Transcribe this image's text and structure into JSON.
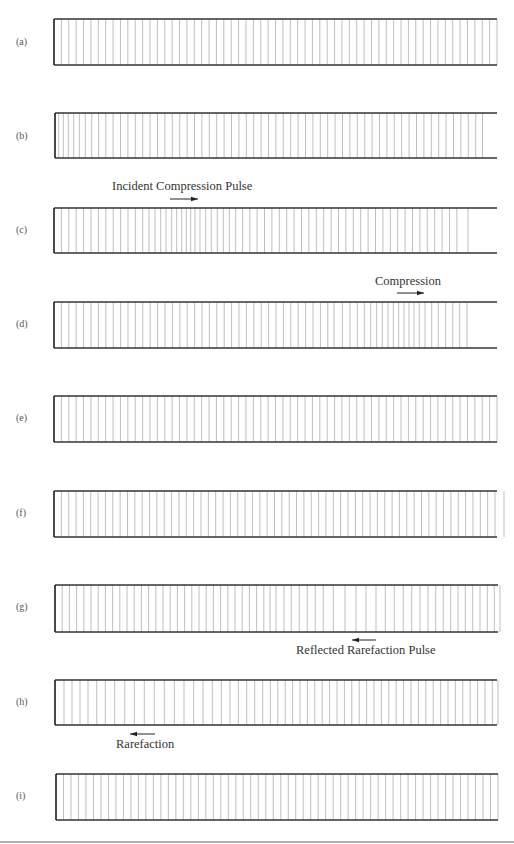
{
  "figure": {
    "colors": {
      "tube_edge": "#333333",
      "particle_line": "#b8b8b8",
      "label": "#555555",
      "annotation": "#333333",
      "page_rule": "#9a9a9a"
    },
    "panels": [
      {
        "id": "a",
        "label": "(a)",
        "label_y": 45,
        "top": 19,
        "bottom": 65,
        "left": 54,
        "right": 497,
        "lines": {
          "mode": "uniform",
          "start": 54,
          "end": 497,
          "count": 61
        }
      },
      {
        "id": "b",
        "label": "(b)",
        "label_y": 139,
        "top": 113,
        "bottom": 158,
        "left": 55,
        "right": 497,
        "lines": {
          "mode": "explicit",
          "x": [
            55,
            58.7,
            63.3,
            68.3,
            73.7,
            79.3,
            85.3,
            91.7,
            98.6,
            105.8,
            113.1,
            120.5,
            127.9,
            135.3,
            142.7,
            150.1,
            157.5,
            164.9,
            172.3,
            179.7,
            187.1,
            194.5,
            201.9,
            209.3,
            216.7,
            224.1,
            231.5,
            238.9,
            246.3,
            253.7,
            261.1,
            268.5,
            275.9,
            283.3,
            290.7,
            298.1,
            305.5,
            312.9,
            320.3,
            327.7,
            335.1,
            342.5,
            349.9,
            357.3,
            364.7,
            372.1,
            379.5,
            386.9,
            394.3,
            401.7,
            409.1,
            416.5,
            423.9,
            431.3,
            438.7,
            446.1,
            453.5,
            460.9,
            468.3,
            475.7,
            482.5
          ]
        }
      },
      {
        "id": "c",
        "label": "(c)",
        "label_y": 233,
        "top": 208,
        "bottom": 253,
        "left": 54,
        "right": 497,
        "annotation": {
          "text": "Incident Compression Pulse",
          "x": 112,
          "y": 190,
          "arrow": {
            "direction": "right",
            "x1": 170,
            "x2": 198,
            "y": 199
          }
        },
        "lines": {
          "mode": "explicit",
          "x": [
            54,
            61.4,
            68.8,
            76.2,
            83.6,
            91,
            98.4,
            105.8,
            113.2,
            120.6,
            128,
            135.4,
            142.7,
            149,
            155,
            160.7,
            166,
            171.7,
            176.7,
            181.7,
            186.3,
            190.7,
            195,
            200,
            205.7,
            211.3,
            217.3,
            223.3,
            229.3,
            235.7,
            242.6,
            249.8,
            257.1,
            264.5,
            271.9,
            279.3,
            286.7,
            294.1,
            301.5,
            308.9,
            316.3,
            323.7,
            331.1,
            338.5,
            345.9,
            353.3,
            360.7,
            368.1,
            375.5,
            382.9,
            390.3,
            397.7,
            405.1,
            412.5,
            419.9,
            427.3,
            434.7,
            442.1,
            449.5,
            456.9,
            468
          ]
        }
      },
      {
        "id": "d",
        "label": "(d)",
        "label_y": 327,
        "top": 302,
        "bottom": 348,
        "left": 54,
        "right": 497,
        "annotation": {
          "text": "Compression",
          "x": 375,
          "y": 285,
          "arrow": {
            "direction": "right",
            "x1": 397,
            "x2": 424,
            "y": 293
          }
        },
        "lines": {
          "mode": "explicit",
          "x": [
            54,
            61.4,
            68.8,
            76.2,
            83.6,
            91,
            98.4,
            105.8,
            113.2,
            120.6,
            128,
            135.4,
            142.8,
            150.2,
            157.6,
            165,
            172.4,
            179.8,
            187.2,
            194.6,
            202,
            209.4,
            216.8,
            224.2,
            231.6,
            239,
            246.4,
            253.8,
            261.2,
            268.6,
            276,
            283.4,
            290.8,
            298.2,
            305.6,
            313,
            320.4,
            327.8,
            334,
            342.3,
            350,
            357.3,
            364.3,
            370.7,
            376.7,
            382.3,
            388,
            393.3,
            398.7,
            404,
            409,
            414,
            419.3,
            425,
            431.7,
            438.3,
            445.7,
            452.7,
            459.7,
            467
          ]
        }
      },
      {
        "id": "e",
        "label": "(e)",
        "label_y": 421,
        "top": 396,
        "bottom": 442,
        "left": 54,
        "right": 497,
        "lines": {
          "mode": "uniform",
          "start": 54,
          "end": 497,
          "count": 61
        }
      },
      {
        "id": "f",
        "label": "(f)",
        "label_y": 516,
        "top": 491,
        "bottom": 537,
        "left": 54,
        "right": 497,
        "lines": {
          "mode": "uniform",
          "start": 54,
          "end": 495,
          "count": 61,
          "extra": [
            504
          ]
        }
      },
      {
        "id": "g",
        "label": "(g)",
        "label_y": 610,
        "top": 585,
        "bottom": 632,
        "left": 55,
        "right": 498,
        "annotation": {
          "text": "Reflected Rarefaction Pulse",
          "x": 296,
          "y": 654,
          "arrow": {
            "direction": "left",
            "x1": 352,
            "x2": 376,
            "y": 640
          }
        },
        "lines": {
          "mode": "explicit",
          "x": [
            55,
            62.2,
            69.4,
            76.6,
            83.8,
            91,
            98.2,
            105.4,
            112.6,
            119.8,
            127,
            134.2,
            141.4,
            148.6,
            155.8,
            163,
            170.2,
            177.4,
            184.6,
            191.8,
            199,
            206.2,
            213.4,
            220.6,
            227.8,
            235,
            242.2,
            249.4,
            256.6,
            263.8,
            270,
            276,
            284,
            291.3,
            299.3,
            307.3,
            315.3,
            323.3,
            333.3,
            345,
            356,
            366,
            376,
            385.3,
            394.3,
            403.3,
            411.7,
            420,
            428,
            435.7,
            443.3,
            450.7,
            458,
            465.3,
            472.7,
            480,
            487.3,
            494.3,
            500
          ]
        }
      },
      {
        "id": "h",
        "label": "(h)",
        "label_y": 705,
        "top": 680,
        "bottom": 725,
        "left": 55,
        "right": 497,
        "annotation": {
          "text": "Rarefaction",
          "x": 116,
          "y": 748,
          "arrow": {
            "direction": "left",
            "x1": 130,
            "x2": 155,
            "y": 734
          }
        },
        "lines": {
          "mode": "explicit",
          "x": [
            55,
            64,
            72,
            80,
            88,
            96.7,
            105.3,
            114.7,
            124.7,
            134.3,
            144.3,
            154.3,
            164.3,
            174.3,
            184,
            193.7,
            203,
            212.3,
            221.3,
            230,
            238.3,
            246.7,
            254.7,
            262.7,
            270.3,
            277.8,
            285.2,
            292.6,
            300,
            307.4,
            314.8,
            322.2,
            329.6,
            337,
            344.4,
            351.8,
            359.2,
            366.6,
            374,
            381.4,
            388.8,
            396.2,
            403.6,
            411,
            418.4,
            425.8,
            433.2,
            440.6,
            448,
            455.4,
            462.8,
            470.2,
            477.6,
            485,
            492.3,
            498
          ]
        }
      },
      {
        "id": "i",
        "label": "(i)",
        "label_y": 799,
        "top": 774,
        "bottom": 820,
        "left": 56,
        "right": 498,
        "lines": {
          "mode": "uniform",
          "start": 56,
          "end": 498,
          "count": 60
        }
      }
    ],
    "page_rule_y": 842
  }
}
